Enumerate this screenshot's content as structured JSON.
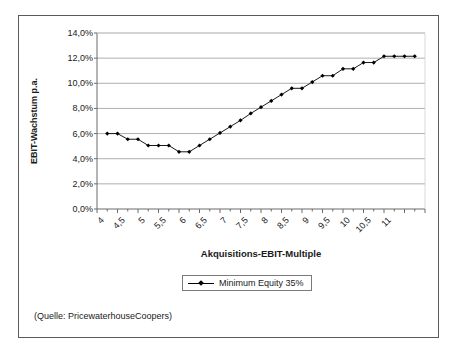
{
  "figure": {
    "source_note": "(Quelle: PricewaterhouseCoopers)",
    "border_color": "#5a5a5a",
    "background": "#ffffff"
  },
  "chart_data": {
    "type": "line",
    "title": "",
    "subtitle": "",
    "xlabel": "Akquisitions-EBIT-Multiple",
    "ylabel": "EBIT-Wachstum p.a.",
    "xlim": [
      4.0,
      12.0
    ],
    "ylim": [
      0.0,
      14.0
    ],
    "yticks": [
      0.0,
      2.0,
      4.0,
      6.0,
      8.0,
      10.0,
      12.0,
      14.0
    ],
    "ytick_labels": [
      "0,0%",
      "2,0%",
      "4,0%",
      "6,0%",
      "8,0%",
      "10,0%",
      "12,0%",
      "14,0%"
    ],
    "xticks": [
      4,
      4.5,
      5,
      5.5,
      6,
      6.5,
      7,
      7.5,
      8,
      8.5,
      9,
      9.5,
      10,
      10.5,
      11
    ],
    "xtick_labels": [
      "4",
      "4,5",
      "5",
      "5,5",
      "6",
      "6,5",
      "7",
      "7,5",
      "8",
      "8,5",
      "9",
      "9,5",
      "10",
      "10,5",
      "11"
    ],
    "grid": "horizontal",
    "legend_position": "below-axis-center",
    "line_color": "#000000",
    "marker": "diamond",
    "series": [
      {
        "name": "Minimum Equity 35%",
        "x": [
          4.25,
          4.5,
          4.75,
          5.0,
          5.25,
          5.5,
          5.75,
          6.0,
          6.25,
          6.5,
          6.75,
          7.0,
          7.25,
          7.5,
          7.75,
          8.0,
          8.25,
          8.5,
          8.75,
          9.0,
          9.25,
          9.5,
          9.75,
          10.0,
          10.25,
          10.5,
          10.75,
          11.0,
          11.25,
          11.5,
          11.75
        ],
        "values": [
          6.0,
          6.0,
          5.55,
          5.55,
          5.05,
          5.05,
          5.05,
          4.55,
          4.55,
          5.05,
          5.55,
          6.05,
          6.55,
          7.05,
          7.6,
          8.1,
          8.6,
          9.1,
          9.6,
          9.6,
          10.1,
          10.6,
          10.6,
          11.15,
          11.15,
          11.65,
          11.65,
          12.15,
          12.15,
          12.15,
          12.15
        ]
      }
    ]
  },
  "axis_title": {
    "x": "Akquisitions-EBIT-Multiple",
    "y": "EBIT-Wachstum p.a."
  },
  "legend": {
    "entries": [
      {
        "label": "Minimum Equity 35%"
      }
    ]
  }
}
